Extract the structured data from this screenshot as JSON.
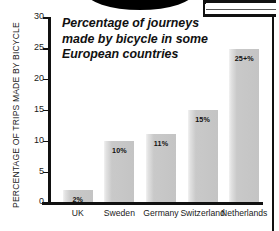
{
  "decor": {
    "top_ellipse": "black-ellipse-shape",
    "top_right_frame": "dark-frame-corner",
    "right_rule": "vertical-rule"
  },
  "chart_data": {
    "type": "bar",
    "title": "Percentage of journeys made by bicycle in some European countries",
    "title_lines": [
      "Percentage of journeys",
      "made by bicycle in some",
      "European countries"
    ],
    "xlabel": "",
    "ylabel": "PERCENTAGE OF TRIPS MADE BY BICYCLE",
    "ylim": [
      0,
      30
    ],
    "yticks": [
      0,
      5,
      10,
      15,
      20,
      25,
      30
    ],
    "ytick_labels": [
      "0",
      "5",
      "10",
      "15",
      "20",
      "25",
      "30"
    ],
    "grid": false,
    "legend": false,
    "categories": [
      "UK",
      "Sweden",
      "Germany",
      "Switzerland",
      "Netherlands"
    ],
    "values": [
      2,
      10,
      11,
      15,
      24.8
    ],
    "data_labels": [
      "2%",
      "10%",
      "11%",
      "15%",
      "25+%"
    ],
    "bar_color": "#c7c7c7",
    "axis_color": "#111111"
  }
}
